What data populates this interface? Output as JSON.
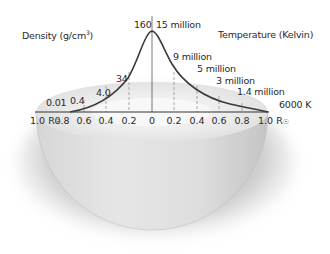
{
  "title_left": "Density (g/cm",
  "title_left_sup": "3",
  "title_left_end": ")",
  "title_right": "Temperature (Kelvin)",
  "density_labels": [
    {
      "text": "160",
      "x": 134,
      "y": 20
    },
    {
      "text": "34",
      "x": 116,
      "y": 74
    },
    {
      "text": "4.0",
      "x": 96,
      "y": 89
    },
    {
      "text": "0.4",
      "x": 70,
      "y": 96
    },
    {
      "text": "0.01",
      "x": 46,
      "y": 98
    }
  ],
  "temperature_labels": [
    {
      "text": "15 million",
      "x": 156,
      "y": 20
    },
    {
      "text": "9 million",
      "x": 173,
      "y": 53
    },
    {
      "text": "5 million",
      "x": 196,
      "y": 65
    },
    {
      "text": "3 million",
      "x": 216,
      "y": 77
    },
    {
      "text": "1.4 million",
      "x": 237,
      "y": 88
    },
    {
      "text": "6000 K",
      "x": 279,
      "y": 100
    }
  ],
  "axis_ticks": [
    {
      "text": "1.0 R",
      "x": 43
    },
    {
      "text": "0.8",
      "x": 62
    },
    {
      "text": "0.6",
      "x": 84
    },
    {
      "text": "0.4",
      "x": 106
    },
    {
      "text": "0.2",
      "x": 129
    },
    {
      "text": "0",
      "x": 152
    },
    {
      "text": "0.2",
      "x": 174
    },
    {
      "text": "0.4",
      "x": 197
    },
    {
      "text": "0.6",
      "x": 219
    },
    {
      "text": "0.8",
      "x": 242
    },
    {
      "text": "1.0 R",
      "x": 264
    }
  ],
  "sun_symbol": "☉"
}
